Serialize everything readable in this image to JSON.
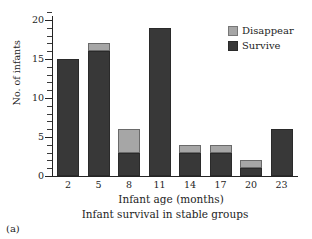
{
  "figure": {
    "panel_label": "(a)",
    "caption": "Infant survival in stable groups"
  },
  "legend": {
    "position": "top-right",
    "entries": [
      {
        "label": "Disappear",
        "color": "#a6a6a6",
        "icon": "legend-swatch-icon"
      },
      {
        "label": "Survive",
        "color": "#383838",
        "icon": "legend-swatch-icon"
      }
    ]
  },
  "axes": {
    "y_ticks": [
      "0",
      "5",
      "10",
      "15",
      "20"
    ],
    "x_ticks": [
      "2",
      "5",
      "8",
      "11",
      "14",
      "17",
      "20",
      "23"
    ]
  },
  "chart_data": {
    "type": "bar",
    "stacked": true,
    "title": "",
    "subtitle": "Infant survival in stable groups",
    "xlabel": "Infant age (months)",
    "ylabel": "No. of infants",
    "categories": [
      "2",
      "5",
      "8",
      "11",
      "14",
      "17",
      "20",
      "23"
    ],
    "series": [
      {
        "name": "Survive",
        "color": "#383838",
        "values": [
          15,
          16,
          3,
          19,
          3,
          3,
          1,
          6
        ]
      },
      {
        "name": "Disappear",
        "color": "#a6a6a6",
        "values": [
          0,
          1,
          3,
          0,
          1,
          1,
          1,
          0
        ]
      }
    ],
    "totals": [
      15,
      17,
      6,
      19,
      4,
      4,
      2,
      6
    ],
    "ylim": [
      0,
      21
    ],
    "yticks": [
      0,
      5,
      10,
      15,
      20
    ],
    "y_minor_ticks": [
      1,
      2,
      3,
      4,
      6,
      7,
      8,
      9,
      11,
      12,
      13,
      14,
      16,
      17,
      18,
      19,
      21
    ],
    "grid": false,
    "legend_position": "top-right"
  }
}
